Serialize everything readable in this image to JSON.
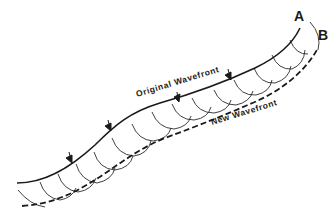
{
  "diagram": {
    "labels": {
      "point_a": "A",
      "point_b": "B",
      "original_wavefront": "Original Wavefront",
      "new_wavefront": "New Wavefront"
    },
    "elements": {
      "original_wavefront_style": "solid",
      "new_wavefront_style": "dashed",
      "secondary_wavelet_count": 15,
      "direction_arrow_count": 4
    },
    "colors": {
      "line": "#1a1a1a",
      "background": "#ffffff"
    }
  }
}
